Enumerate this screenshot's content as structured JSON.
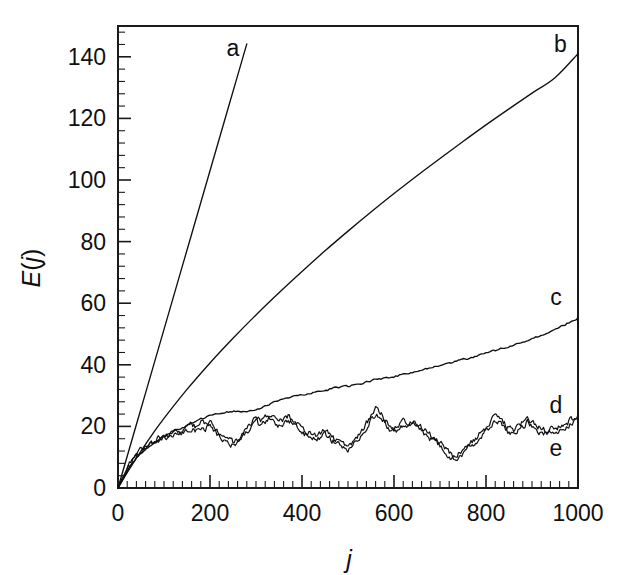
{
  "chart_data": {
    "type": "line",
    "title": "",
    "subtitle": "",
    "xlabel": "j",
    "ylabel": "E(j)",
    "xlim": [
      0,
      1000
    ],
    "ylim": [
      0,
      150
    ],
    "grid": false,
    "legend_position": "inline-right",
    "x_ticks": [
      0,
      200,
      400,
      600,
      800,
      1000
    ],
    "x_tick_labels": [
      "0",
      "200",
      "400",
      "600",
      "800",
      "1000"
    ],
    "x_minor_step": 20,
    "y_ticks": [
      0,
      20,
      40,
      60,
      80,
      100,
      120,
      140
    ],
    "y_tick_labels": [
      "0",
      "20",
      "40",
      "60",
      "80",
      "100",
      "120",
      "140"
    ],
    "y_minor_step": 4,
    "series": [
      {
        "name": "a",
        "label": "a",
        "label_x": 250,
        "label_y": 143,
        "note": "straight line, steep slope, exits top of plot near j=290",
        "x": [
          0,
          20,
          40,
          60,
          80,
          100,
          120,
          140,
          160,
          180,
          200,
          220,
          240,
          260,
          280,
          292
        ],
        "values": [
          0,
          10.3,
          20.6,
          30.9,
          41.2,
          51.5,
          61.8,
          72.1,
          82.4,
          92.7,
          103,
          113.3,
          123.6,
          133.9,
          144.2,
          150.4
        ]
      },
      {
        "name": "b",
        "label": "b",
        "label_x": 962,
        "label_y": 144,
        "note": "concave-down growth, reaches about 141 at j=1000",
        "x": [
          0,
          25,
          50,
          75,
          100,
          150,
          200,
          250,
          300,
          350,
          400,
          450,
          500,
          550,
          600,
          650,
          700,
          750,
          800,
          850,
          900,
          950,
          1000
        ],
        "values": [
          0,
          6.2,
          12.0,
          17.5,
          22.6,
          32.0,
          40.6,
          48.6,
          56.2,
          63.4,
          70.3,
          77.0,
          83.4,
          89.6,
          95.6,
          101.4,
          107.0,
          112.5,
          117.9,
          123.1,
          128.2,
          133.2,
          141.0
        ]
      },
      {
        "name": "c",
        "label": "c",
        "label_x": 952,
        "label_y": 62,
        "note": "slightly noisy near-linear rise after early curvature, about 55 at j=1000",
        "x": [
          0,
          20,
          40,
          60,
          80,
          100,
          120,
          140,
          160,
          180,
          200,
          220,
          240,
          260,
          280,
          300,
          320,
          340,
          360,
          380,
          400,
          420,
          440,
          460,
          480,
          500,
          520,
          540,
          560,
          580,
          600,
          620,
          640,
          660,
          680,
          700,
          720,
          740,
          760,
          780,
          800,
          820,
          840,
          860,
          880,
          900,
          920,
          940,
          960,
          980,
          1000
        ],
        "values": [
          0,
          5.5,
          9.8,
          12.6,
          14.8,
          16.6,
          18.2,
          19.6,
          21.0,
          22.3,
          23.4,
          24.2,
          24.7,
          25.1,
          24.9,
          25.4,
          26.6,
          27.8,
          28.8,
          29.6,
          30.2,
          30.7,
          31.3,
          32.1,
          32.6,
          33.0,
          33.6,
          34.5,
          35.3,
          35.6,
          36.2,
          36.9,
          37.6,
          38.3,
          39.0,
          39.6,
          40.4,
          41.3,
          42.1,
          42.9,
          43.7,
          44.6,
          45.5,
          46.4,
          47.3,
          48.3,
          49.5,
          50.8,
          52.1,
          53.6,
          55.2
        ]
      },
      {
        "name": "d",
        "label": "d",
        "label_x": 952,
        "label_y": 27,
        "note": "strongly fluctuating, saturates around 10-27, sits slightly above curve e",
        "x": [
          0,
          10,
          20,
          30,
          40,
          50,
          60,
          70,
          80,
          90,
          100,
          110,
          120,
          130,
          140,
          150,
          160,
          170,
          180,
          190,
          200,
          210,
          220,
          230,
          240,
          250,
          260,
          270,
          280,
          290,
          300,
          310,
          320,
          330,
          340,
          350,
          360,
          370,
          380,
          390,
          400,
          410,
          420,
          430,
          440,
          450,
          460,
          470,
          480,
          490,
          500,
          510,
          520,
          530,
          540,
          550,
          560,
          570,
          580,
          590,
          600,
          610,
          620,
          630,
          640,
          650,
          660,
          670,
          680,
          690,
          700,
          710,
          720,
          730,
          740,
          750,
          760,
          770,
          780,
          790,
          800,
          810,
          820,
          830,
          840,
          850,
          860,
          870,
          880,
          890,
          900,
          910,
          920,
          930,
          940,
          950,
          960,
          970,
          980,
          990,
          1000
        ],
        "values": [
          0,
          3.4,
          6.3,
          8.9,
          10.8,
          12.4,
          13.6,
          14.6,
          15.3,
          16.4,
          17.1,
          17.0,
          17.8,
          18.6,
          18.2,
          19.4,
          20.5,
          19.8,
          21.3,
          20.4,
          21.6,
          19.4,
          18.0,
          16.6,
          15.4,
          14.9,
          15.6,
          17.1,
          19.3,
          21.2,
          22.7,
          21.6,
          23.0,
          24.4,
          22.7,
          21.5,
          22.4,
          23.2,
          22.1,
          20.6,
          19.4,
          18.2,
          17.5,
          16.9,
          17.8,
          18.8,
          17.6,
          16.1,
          15.0,
          14.2,
          13.8,
          14.8,
          16.7,
          18.9,
          21.0,
          23.4,
          25.6,
          24.2,
          22.3,
          20.6,
          19.4,
          20.6,
          21.8,
          20.4,
          22.1,
          21.0,
          19.4,
          18.2,
          17.1,
          16.2,
          15.1,
          13.4,
          11.5,
          10.3,
          11.2,
          12.6,
          13.8,
          15.0,
          16.4,
          18.1,
          19.8,
          21.6,
          23.2,
          22.1,
          20.8,
          19.4,
          18.6,
          19.8,
          21.4,
          22.6,
          21.3,
          20.1,
          19.3,
          18.7,
          19.2,
          19.6,
          20.1,
          20.8,
          21.6,
          22.6,
          23.6
        ]
      },
      {
        "name": "e",
        "label": "e",
        "label_x": 952,
        "label_y": 13,
        "note": "nearly coincident with curve d, tracking about 1-2 units lower",
        "x": [
          0,
          10,
          20,
          30,
          40,
          50,
          60,
          70,
          80,
          90,
          100,
          110,
          120,
          130,
          140,
          150,
          160,
          170,
          180,
          190,
          200,
          210,
          220,
          230,
          240,
          250,
          260,
          270,
          280,
          290,
          300,
          310,
          320,
          330,
          340,
          350,
          360,
          370,
          380,
          390,
          400,
          410,
          420,
          430,
          440,
          450,
          460,
          470,
          480,
          490,
          500,
          510,
          520,
          530,
          540,
          550,
          560,
          570,
          580,
          590,
          600,
          610,
          620,
          630,
          640,
          650,
          660,
          670,
          680,
          690,
          700,
          710,
          720,
          730,
          740,
          750,
          760,
          770,
          780,
          790,
          800,
          810,
          820,
          830,
          840,
          850,
          860,
          870,
          880,
          890,
          900,
          910,
          920,
          930,
          940,
          950,
          960,
          970,
          980,
          990,
          1000
        ],
        "values": [
          0,
          3.2,
          6.0,
          8.5,
          10.3,
          11.8,
          12.9,
          13.8,
          14.5,
          15.5,
          16.1,
          16.0,
          16.8,
          17.5,
          17.1,
          18.3,
          19.4,
          18.6,
          20.0,
          19.2,
          20.3,
          18.1,
          16.7,
          15.3,
          14.2,
          13.7,
          14.4,
          15.9,
          18.0,
          19.9,
          21.3,
          20.3,
          21.7,
          23.0,
          21.4,
          20.2,
          21.1,
          21.9,
          20.8,
          19.3,
          18.1,
          17.0,
          16.3,
          15.7,
          16.5,
          17.5,
          16.3,
          14.9,
          13.8,
          13.0,
          12.6,
          13.5,
          15.4,
          17.6,
          19.7,
          22.0,
          24.2,
          22.8,
          21.0,
          19.3,
          18.1,
          19.3,
          20.5,
          19.1,
          20.8,
          19.7,
          18.1,
          16.9,
          15.9,
          15.0,
          13.9,
          12.3,
          10.4,
          9.2,
          10.1,
          11.4,
          12.6,
          13.8,
          15.1,
          16.8,
          18.5,
          20.3,
          21.9,
          20.8,
          19.5,
          18.2,
          17.4,
          18.6,
          20.1,
          21.3,
          20.0,
          18.9,
          18.1,
          17.5,
          18.0,
          18.4,
          18.9,
          19.6,
          20.4,
          21.4,
          22.4
        ]
      }
    ]
  },
  "colors": {
    "background": "#ffffff",
    "ink": "#101010",
    "axis": "#1a1a1a"
  }
}
